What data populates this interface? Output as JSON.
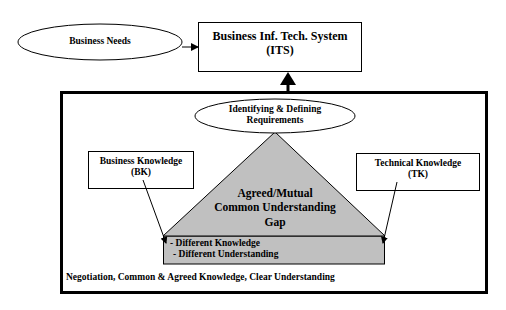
{
  "diagram": {
    "business_needs": {
      "label": "Business Needs"
    },
    "its_box": {
      "line1": "Business Inf. Tech. System",
      "line2": "(ITS)"
    },
    "requirements": {
      "line1": "Identifying & Defining",
      "line2": "Requirements"
    },
    "bk_box": {
      "line1": "Business Knowledge",
      "line2": "(BK)"
    },
    "tk_box": {
      "line1": "Technical Knowledge",
      "line2": "(TK)"
    },
    "triangle": {
      "line1": "Agreed/Mutual",
      "line2": "Common Understanding",
      "line3": "Gap"
    },
    "gap_list": {
      "item1": "- Different Knowledge",
      "item2": "- Different Understanding"
    },
    "footer": {
      "label": "Negotiation, Common & Agreed Knowledge, Clear Understanding"
    },
    "colors": {
      "fill_gray": "#c0c0c0",
      "stroke": "#000000",
      "background": "#ffffff"
    }
  }
}
